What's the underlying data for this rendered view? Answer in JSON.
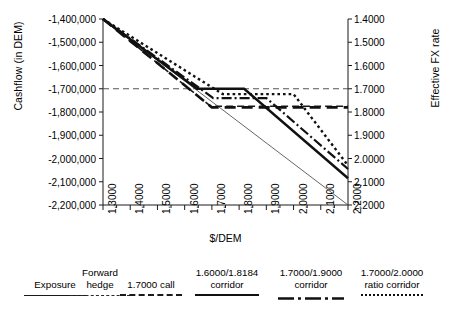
{
  "chart_data": {
    "type": "line",
    "title": "",
    "xlabel": "$/DEM",
    "ylabel": "Cashflow (in DEM)",
    "ylabel_right": "Effective FX rate",
    "grid": false,
    "legend_position": "bottom",
    "x": [
      1.3,
      2.2
    ],
    "xlim": [
      1.3,
      2.2
    ],
    "ylim": [
      -2200000,
      -1400000
    ],
    "ylim_right": [
      2.2,
      1.4
    ],
    "xticks": [
      "1.3000",
      "1.4000",
      "1.5000",
      "1.6000",
      "1.7000",
      "1.8000",
      "1.9000",
      "2.0000",
      "2.1000",
      "2.2000"
    ],
    "yticks_left": [
      "-1,400,000",
      "-1,500,000",
      "-1,600,000",
      "-1,700,000",
      "-1,800,000",
      "-1,900,000",
      "-2,000,000",
      "-2,100,000",
      "-2,200,000"
    ],
    "yticks_right": [
      "1.4000",
      "1.5000",
      "1.6000",
      "1.7000",
      "1.8000",
      "1.9000",
      "2.0000",
      "2.1000",
      "2.2000"
    ],
    "reference_line": {
      "label": "1.7000 reference",
      "y": -1700000,
      "style": "dashed"
    },
    "series": [
      {
        "name": "Exposure",
        "style": "solid-thin",
        "points": [
          [
            1.3,
            -1400000
          ],
          [
            2.2,
            -2200000
          ]
        ]
      },
      {
        "name": "Forward hedge",
        "style": "dash-small",
        "points": [
          [
            1.3,
            -1400000
          ],
          [
            1.695,
            -1775000
          ],
          [
            2.2,
            -1775000
          ]
        ]
      },
      {
        "name": "1.7000 call",
        "style": "dash-large",
        "points": [
          [
            1.3,
            -1400000
          ],
          [
            1.7,
            -1780000
          ],
          [
            2.2,
            -1780000
          ]
        ]
      },
      {
        "name": "1.6000/1.8184 corridor",
        "style": "solid-thick",
        "points": [
          [
            1.3,
            -1400000
          ],
          [
            1.645,
            -1700000
          ],
          [
            1.8184,
            -1700000
          ],
          [
            2.2,
            -2085000
          ]
        ]
      },
      {
        "name": "1.7000/1.9000 corridor",
        "style": "dash-dot",
        "points": [
          [
            1.3,
            -1400000
          ],
          [
            1.705,
            -1740000
          ],
          [
            1.9,
            -1740000
          ],
          [
            2.2,
            -2045000
          ]
        ]
      },
      {
        "name": "1.7000/2.0000 ratio corridor",
        "style": "dotted",
        "points": [
          [
            1.3,
            -1400000
          ],
          [
            1.74,
            -1723000
          ],
          [
            2.0,
            -1723000
          ],
          [
            2.2,
            -2030000
          ]
        ]
      }
    ]
  },
  "legend": {
    "items": [
      {
        "lines": [
          "Exposure"
        ],
        "style": "solid-thin"
      },
      {
        "lines": [
          "Forward",
          "hedge"
        ],
        "style": "dash-small"
      },
      {
        "lines": [
          "1.7000 call"
        ],
        "style": "dash-large"
      },
      {
        "lines": [
          "1.6000/1.8184",
          "corridor"
        ],
        "style": "solid-thick"
      },
      {
        "lines": [
          "1.7000/1.9000",
          "corridor"
        ],
        "style": "dash-dot"
      },
      {
        "lines": [
          "1.7000/2.0000",
          "ratio corridor"
        ],
        "style": "dotted"
      }
    ]
  }
}
